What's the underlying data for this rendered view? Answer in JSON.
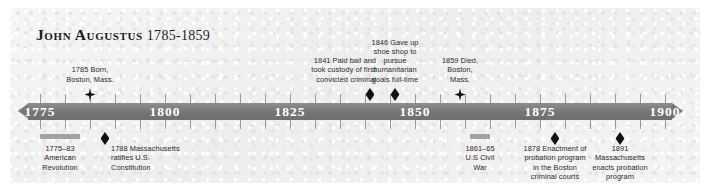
{
  "title": {
    "name": "John Augustus",
    "years": "1785-1859"
  },
  "axis": {
    "start_year": 1775,
    "end_year": 1900,
    "labels": [
      "1775",
      "1800",
      "1825",
      "1850",
      "1875",
      "1900"
    ],
    "label_years": [
      1775,
      1800,
      1825,
      1850,
      1875,
      1900
    ],
    "minor_tick_interval": 5,
    "bar_color": "#757575",
    "label_color": "#ffffff"
  },
  "events_above": [
    {
      "year": 1785,
      "marker": "star",
      "align": "center",
      "text": "1785 Born,\nBoston, Mass."
    },
    {
      "year": 1841,
      "marker": "solid",
      "align": "right",
      "text": "1841 Paid bail and\ntook custody of first\nconvicted criminal"
    },
    {
      "year": 1846,
      "marker": "solid",
      "align": "center",
      "text": "1846 Gave up\nshoe shop to\npursue\nhumanitarian\ngoals full-time"
    },
    {
      "year": 1859,
      "marker": "star",
      "align": "center",
      "text": "1859 Died,\nBoston,\nMass."
    }
  ],
  "events_below": [
    {
      "start_year": 1775,
      "end_year": 1783,
      "marker": "span",
      "align": "center",
      "text": "1775–83\nAmerican\nRevolution"
    },
    {
      "year": 1788,
      "marker": "solid",
      "align": "left",
      "text": "1788 Massachusetts\nratifies U.S.\nConstitution"
    },
    {
      "start_year": 1861,
      "end_year": 1865,
      "marker": "span",
      "align": "center",
      "text": "1861–65\nU.S Civil\nWar"
    },
    {
      "year": 1878,
      "marker": "solid",
      "align": "center",
      "text": "1878 Enactment of\nprobation program\nin the Boston\ncriminal courts"
    },
    {
      "year": 1891,
      "marker": "solid",
      "align": "center",
      "text": "1891\nMassachusetts\nenacts probation\nprogram"
    }
  ]
}
